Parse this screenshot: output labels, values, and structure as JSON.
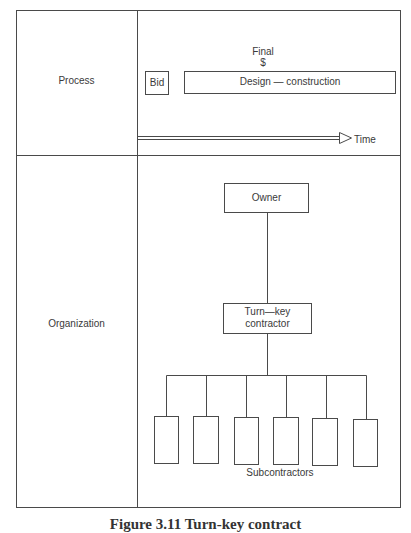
{
  "diagram": {
    "rows": [
      {
        "label": "Process"
      },
      {
        "label": "Organization"
      }
    ],
    "process": {
      "bid_label": "Bid",
      "final_label": "Final",
      "dollar_label": "$",
      "phase_label": "Design — construction",
      "time_label": "Time"
    },
    "organization": {
      "owner_label": "Owner",
      "contractor_line1": "Turn—key",
      "contractor_line2": "contractor",
      "subcontractors_label": "Subcontractors",
      "subcontractor_count": 6
    },
    "caption": "Figure 3.11  Turn-key contract"
  }
}
